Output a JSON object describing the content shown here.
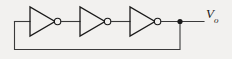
{
  "figure": {
    "type": "schematic",
    "background_color": "#f2f1ef",
    "wire_color": "#3a3a3a",
    "gate_color": "#1a1a1a"
  },
  "labels": {
    "output_symbol": "V",
    "output_subscript": "o",
    "output_full": "Vo"
  },
  "components": {
    "inverters": [
      {
        "name": "inverter-1",
        "x": 30,
        "y_top": 7,
        "y_bottom": 36,
        "apex_x": 55,
        "bubble_cx": 57.5,
        "bubble_cy": 21.5,
        "bubble_r": 3.2
      },
      {
        "name": "inverter-2",
        "x": 80,
        "y_top": 7,
        "y_bottom": 36,
        "apex_x": 105,
        "bubble_cx": 107.5,
        "bubble_cy": 21.5,
        "bubble_r": 3.2
      },
      {
        "name": "inverter-3",
        "x": 130,
        "y_top": 7,
        "y_bottom": 36,
        "apex_x": 155,
        "bubble_cx": 157.5,
        "bubble_cy": 21.5,
        "bubble_r": 3.2
      }
    ],
    "junction_dot": {
      "name": "output-node",
      "cx": 180,
      "cy": 21.5,
      "r": 2.6
    },
    "wires": [
      {
        "name": "input-wire-1",
        "d": "M 14 21.5 L 30 21.5"
      },
      {
        "name": "interconnect-1-2",
        "d": "M 60.7 21.5 L 80 21.5"
      },
      {
        "name": "interconnect-2-3",
        "d": "M 110.7 21.5 L 130 21.5"
      },
      {
        "name": "output-wire",
        "d": "M 160.7 21.5 L 204 21.5"
      },
      {
        "name": "feedback-loop",
        "d": "M 180 21.5 L 180 49 L 14 49 L 14 21.5"
      }
    ]
  }
}
